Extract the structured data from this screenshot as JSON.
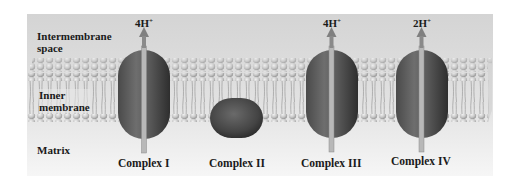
{
  "regions": {
    "intermembrane_line1": "Intermembrane",
    "intermembrane_line2": "space",
    "inner_membrane_line1": "Inner",
    "inner_membrane_line2": "membrane",
    "matrix": "Matrix"
  },
  "complexes": [
    {
      "name": "Complex I",
      "proton_count": "4H",
      "charge": "+",
      "has_arrow": true
    },
    {
      "name": "Complex II",
      "proton_count": "",
      "charge": "",
      "has_arrow": false
    },
    {
      "name": "Complex III",
      "proton_count": "4H",
      "charge": "+",
      "has_arrow": true
    },
    {
      "name": "Complex IV",
      "proton_count": "2H",
      "charge": "+",
      "has_arrow": true
    }
  ],
  "colors": {
    "background_top": "#d6d6d6",
    "background_bottom": "#f4f4f4",
    "protein_dark": "#3a3a3a",
    "protein_mid": "#6a6a6a",
    "lipid_head": "#c8c8c8",
    "arrow": "#8a8a8a"
  }
}
